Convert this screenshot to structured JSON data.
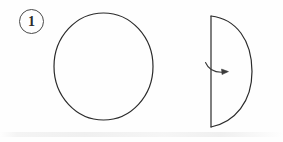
{
  "figure": {
    "background_color": "#fefefe",
    "ink_color": "#2b2b2b",
    "width": 283,
    "height": 142,
    "step_badge": {
      "label": "1",
      "shape": "circle",
      "center_x": 31.5,
      "center_y": 21.5,
      "radius": 12.5,
      "stroke_color": "#4a4a4a"
    },
    "shapes": [
      {
        "name": "full-circle",
        "type": "circle",
        "center_x": 103.5,
        "center_y": 66.5,
        "radius_x": 49.5,
        "radius_y": 53.5,
        "stroke_color": "#2b2b2b",
        "stroke_width": 1.2,
        "fill": "none"
      },
      {
        "name": "half-circle",
        "type": "semicircle",
        "straight_edge_x": 211,
        "top_y": 16,
        "bottom_y": 127,
        "arc_extent_x": 252,
        "orientation": "bulge-right",
        "stroke_color": "#2b2b2b",
        "stroke_width": 1.2,
        "fill": "none"
      }
    ],
    "arrow": {
      "name": "fold-arrow",
      "type": "curved-arrow",
      "start_x": 206,
      "start_y": 62,
      "end_x": 228,
      "end_y": 72,
      "direction": "clockwise-right",
      "stroke_color": "#3a3a3a",
      "stroke_width": 1.1
    },
    "artifact": {
      "name": "scan-smudge",
      "color": "#f2f2f2"
    }
  }
}
